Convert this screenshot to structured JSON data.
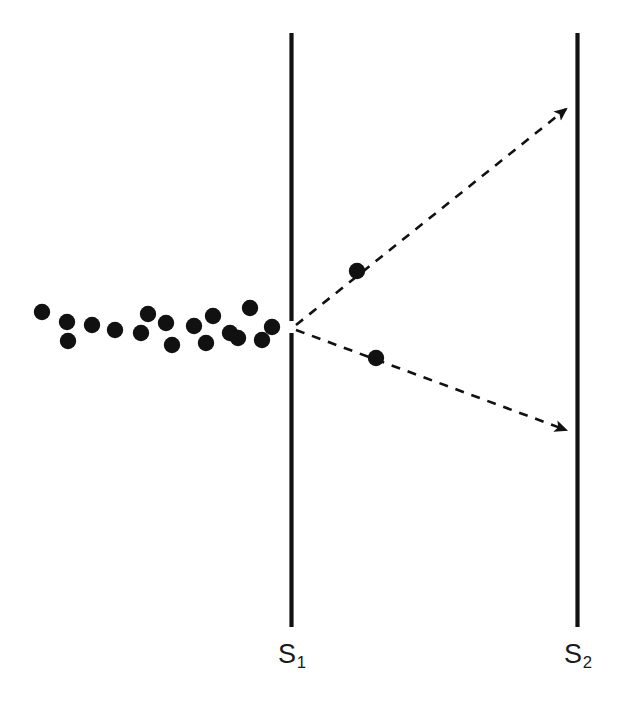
{
  "figure": {
    "name": "double-slit-diffraction-diagram",
    "background_color": "#ffffff",
    "stroke_color": "#111111",
    "particle_color": "#111111",
    "width": 621,
    "height": 712
  },
  "barriers": [
    {
      "id": "s1",
      "label": "S",
      "subscript": "1",
      "x": 291.5,
      "y_top": 33,
      "y_bottom": 627,
      "thickness": 4.2,
      "slit": {
        "y_center": 327,
        "gap": 12
      }
    },
    {
      "id": "s2",
      "label": "S",
      "subscript": "2",
      "x": 577.5,
      "y_top": 33,
      "y_bottom": 627,
      "thickness": 4.2,
      "slit": null
    }
  ],
  "rays": [
    {
      "id": "upper-ray",
      "style": "dashed",
      "from": {
        "x": 296,
        "y": 325
      },
      "to": {
        "x": 571,
        "y": 105
      },
      "arrowhead": true,
      "dash": "9 8",
      "width": 2.6
    },
    {
      "id": "lower-ray",
      "style": "dashed",
      "from": {
        "x": 296,
        "y": 330
      },
      "to": {
        "x": 571,
        "y": 432
      },
      "arrowhead": true,
      "dash": "9 8",
      "width": 2.6
    }
  ],
  "particles": {
    "incident_cloud": {
      "name": "incident-particle-cloud",
      "count": 17,
      "radius": 8.2,
      "points": [
        {
          "x": 42,
          "y": 312
        },
        {
          "x": 67,
          "y": 322
        },
        {
          "x": 68,
          "y": 341
        },
        {
          "x": 92,
          "y": 325
        },
        {
          "x": 115,
          "y": 330
        },
        {
          "x": 141,
          "y": 333
        },
        {
          "x": 148,
          "y": 314
        },
        {
          "x": 166,
          "y": 323
        },
        {
          "x": 172,
          "y": 345
        },
        {
          "x": 194,
          "y": 326
        },
        {
          "x": 206,
          "y": 343
        },
        {
          "x": 213,
          "y": 316
        },
        {
          "x": 230,
          "y": 333
        },
        {
          "x": 238,
          "y": 338
        },
        {
          "x": 250,
          "y": 308
        },
        {
          "x": 262,
          "y": 340
        },
        {
          "x": 272,
          "y": 327
        }
      ]
    },
    "diffracted": {
      "name": "diffracted-particles",
      "radius": 8.2,
      "points": [
        {
          "x": 357,
          "y": 271,
          "on_ray": "upper-ray"
        },
        {
          "x": 376,
          "y": 358,
          "on_ray": "lower-ray"
        }
      ]
    }
  },
  "labels": {
    "s1": {
      "text": "S",
      "sub": "1"
    },
    "s2": {
      "text": "S",
      "sub": "2"
    }
  }
}
